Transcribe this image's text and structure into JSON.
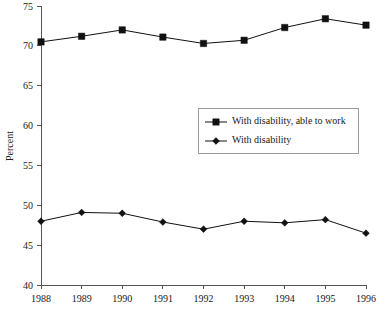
{
  "chart_data": {
    "type": "line",
    "title": "",
    "xlabel": "",
    "ylabel": "Percent",
    "categories": [
      "1988",
      "1989",
      "1990",
      "1991",
      "1992",
      "1993",
      "1994",
      "1995",
      "1996"
    ],
    "x": [
      1988,
      1989,
      1990,
      1991,
      1992,
      1993,
      1994,
      1995,
      1996
    ],
    "ylim": [
      40,
      75
    ],
    "yticks": [
      40,
      45,
      50,
      55,
      60,
      65,
      70,
      75
    ],
    "ytick_labels": [
      "40",
      "45",
      "50",
      "55",
      "60",
      "65",
      "70",
      "75"
    ],
    "grid": false,
    "legend_position": "center-right",
    "series": [
      {
        "name": "With disability, able to work",
        "marker": "square",
        "color": "#111111",
        "values": [
          70.5,
          71.2,
          72.0,
          71.1,
          70.3,
          70.7,
          72.3,
          73.4,
          72.6
        ]
      },
      {
        "name": "With disability",
        "marker": "diamond",
        "color": "#111111",
        "values": [
          48.0,
          49.1,
          49.0,
          47.9,
          47.0,
          48.0,
          47.8,
          48.2,
          46.5
        ]
      }
    ]
  },
  "axes": {
    "y_axis_title": "Percent"
  },
  "legend": {
    "entries": [
      {
        "label": "With disability, able to work",
        "marker": "square-marker-icon"
      },
      {
        "label": "With disability",
        "marker": "diamond-marker-icon"
      }
    ]
  }
}
